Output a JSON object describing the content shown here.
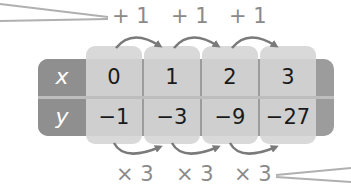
{
  "table": {
    "rows": [
      {
        "header": "x",
        "values": [
          "0",
          "1",
          "2",
          "3"
        ]
      },
      {
        "header": "y",
        "values": [
          "−1",
          "−3",
          "−9",
          "−27"
        ]
      }
    ]
  },
  "top_steps": [
    "+ 1",
    "+ 1",
    "+ 1"
  ],
  "bottom_steps": [
    "× 3",
    "× 3",
    "× 3"
  ],
  "colors": {
    "header_bg": "#8f8f8f",
    "cell_bg": "#cfcfcf",
    "tab_bg": "#d9d9d9",
    "arrow": "#7a7a7a",
    "label_text": "#8a8a8a"
  }
}
